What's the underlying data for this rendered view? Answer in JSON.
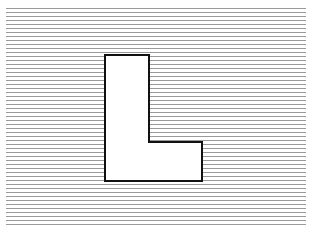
{
  "figure": {
    "letter": "L",
    "background_color": "#ffffff",
    "lines": {
      "color": "#9a9a9a",
      "x_start": 6,
      "x_end": 306,
      "y_start": 8,
      "y_end": 225,
      "spacing": 4,
      "thickness": 1
    },
    "shape": {
      "fill": "#ffffff",
      "stroke": "#111111",
      "stroke_width": 2,
      "points": [
        [
          105,
          55
        ],
        [
          149,
          55
        ],
        [
          149,
          142
        ],
        [
          202,
          142
        ],
        [
          202,
          181
        ],
        [
          105,
          181
        ]
      ]
    }
  }
}
